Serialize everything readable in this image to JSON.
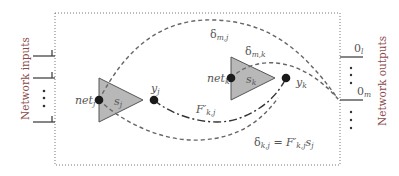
{
  "diagram": {
    "left_label": "Network inputs",
    "right_label": "Network outputs",
    "neuron_j": {
      "net_label": "net",
      "net_sub": "j",
      "state_label": "s",
      "state_sub": "j",
      "output_label": "y",
      "output_sub": "j"
    },
    "neuron_k": {
      "net_label": "net",
      "net_sub": "k",
      "state_label": "s",
      "state_sub": "k",
      "output_label": "y",
      "output_sub": "k"
    },
    "connection": {
      "label": "F′",
      "sub": "k,j"
    },
    "delta_mj": {
      "label": "δ",
      "sub": "m,j"
    },
    "delta_mk": {
      "label": "δ",
      "sub": "m,k"
    },
    "delta_kj_equation": {
      "lhs": "δ",
      "lhs_sub": "k,j",
      "eq": " = ",
      "rhs_F": "F′",
      "rhs_F_sub": "k,j",
      "rhs_s": "s",
      "rhs_s_sub": "j"
    },
    "outputs": [
      {
        "label": "0",
        "sub": "l"
      },
      {
        "label": "0",
        "sub": "m"
      }
    ],
    "colors": {
      "triangle_fill": "#b8b8b8",
      "stroke": "#555555",
      "node": "#1a1a1a",
      "axis_label": "#8b4a4a"
    }
  }
}
